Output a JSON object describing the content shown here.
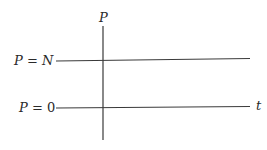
{
  "diagram": {
    "axis_vertical_label": "P",
    "axis_horizontal_label": "t",
    "equilibria": [
      {
        "var": "P",
        "eq": " = ",
        "value": "N",
        "value_italic": true
      },
      {
        "var": "P",
        "eq": " = ",
        "value": "0",
        "value_italic": false
      }
    ],
    "colors": {
      "line": "#3a3a3a",
      "text": "#2a2a2a",
      "background": "#ffffff"
    }
  }
}
